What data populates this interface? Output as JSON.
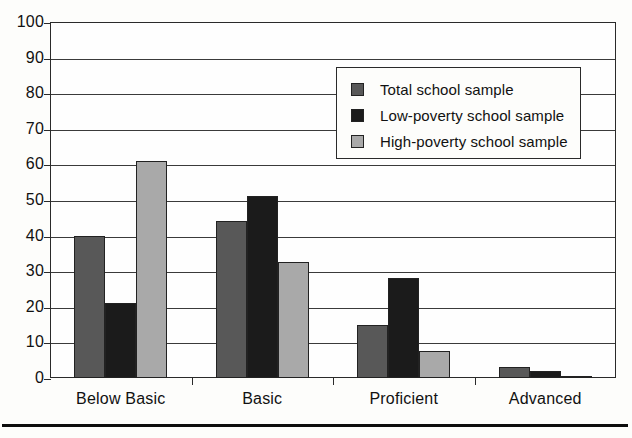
{
  "chart_data": {
    "type": "bar",
    "title": "",
    "subtitle": "",
    "xlabel": "",
    "ylabel": "",
    "categories": [
      "Below Basic",
      "Basic",
      "Proficient",
      "Advanced"
    ],
    "series": [
      {
        "name": "Total school sample",
        "color": "#585858",
        "values": [
          40,
          44,
          15,
          3
        ]
      },
      {
        "name": "Low-poverty school sample",
        "color": "#1b1b1b",
        "values": [
          21,
          51,
          28,
          2
        ]
      },
      {
        "name": "High-poverty school sample",
        "color": "#a9a9a9",
        "values": [
          61,
          32.5,
          7.5,
          0.5
        ]
      }
    ],
    "ylim": [
      0,
      100
    ],
    "yticks": [
      0,
      10,
      20,
      30,
      40,
      50,
      60,
      70,
      80,
      90,
      100
    ],
    "ytick_labels": [
      "0",
      "10",
      "20",
      "30",
      "40",
      "50",
      "60",
      "70",
      "80",
      "90",
      "100"
    ],
    "grid": true,
    "grid_axis": "y",
    "legend_position": "upper right",
    "legend_entries": [
      "Total school sample",
      "Low-poverty school sample",
      "High-poverty school sample"
    ]
  },
  "figure": {
    "axis_color": "#2a2a2a",
    "background": "#fdfdfb",
    "bottom_rule_color": "#0d0d0d"
  }
}
